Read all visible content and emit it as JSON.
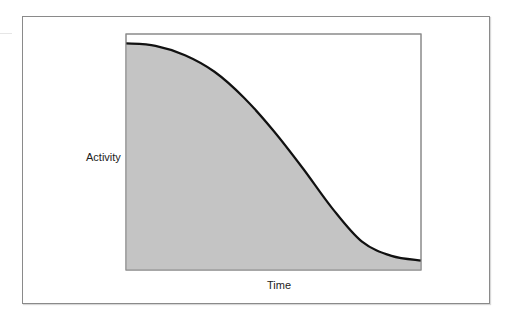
{
  "chart_data": {
    "type": "area",
    "title": "",
    "xlabel": "Time",
    "ylabel": "Activity",
    "grid": false,
    "legend": null,
    "ticks": {
      "x": [],
      "y": []
    },
    "x": [
      0,
      0.1,
      0.2,
      0.3,
      0.4,
      0.5,
      0.6,
      0.7,
      0.8,
      0.9,
      1.0
    ],
    "series": [
      {
        "name": "Activity",
        "values": [
          0.96,
          0.95,
          0.91,
          0.84,
          0.73,
          0.59,
          0.43,
          0.26,
          0.12,
          0.06,
          0.04
        ]
      }
    ],
    "xlim": [
      0,
      1
    ],
    "ylim": [
      0,
      1
    ],
    "colors": {
      "fill": "#c4c4c4",
      "line": "#111111",
      "border": "#8a8a8a"
    }
  }
}
